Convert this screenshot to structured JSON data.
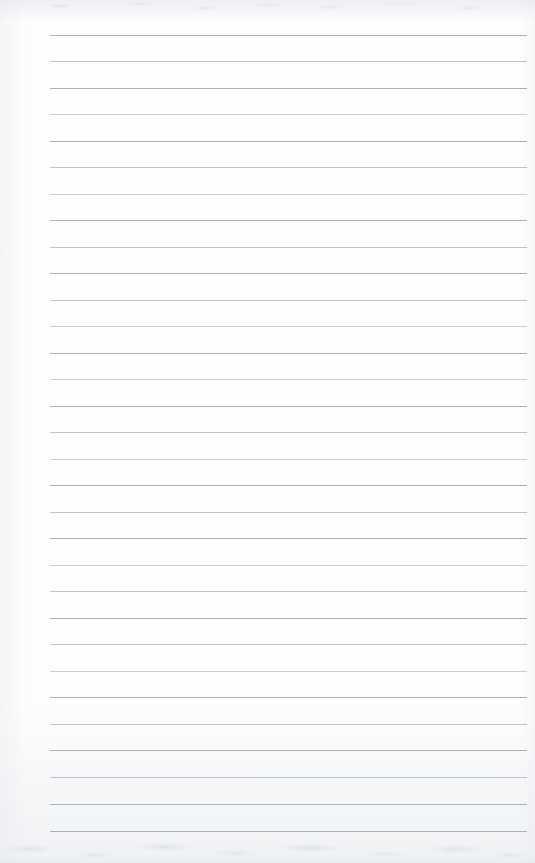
{
  "document": {
    "kind": "scanned-lined-notebook-page",
    "title": "Lined Notebook Page",
    "content_text": "",
    "is_blank": "true",
    "page_width": 535,
    "page_height": 863,
    "background_color": "#fdfdfd",
    "rule_color": "#a9b1bd",
    "rule_color_faint": "#bcc3cd",
    "rule_color_fainter": "#c8ced7"
  },
  "ruling": {
    "style": "horizontal-ruled",
    "line_count": 31,
    "first_line_y": 35,
    "line_spacing": 26.5,
    "line_left_x": 50,
    "line_right_x": 527,
    "line_thickness": 1,
    "vertical_margin_rule": "none",
    "left_margin_width": 50,
    "right_margin_width": 8
  },
  "lines": [
    {
      "index": 1,
      "y": 35,
      "tone": "normal"
    },
    {
      "index": 2,
      "y": 61,
      "tone": "faint"
    },
    {
      "index": 3,
      "y": 88,
      "tone": "normal"
    },
    {
      "index": 4,
      "y": 114,
      "tone": "fainter"
    },
    {
      "index": 5,
      "y": 141,
      "tone": "normal"
    },
    {
      "index": 6,
      "y": 167,
      "tone": "faint"
    },
    {
      "index": 7,
      "y": 194,
      "tone": "fainter"
    },
    {
      "index": 8,
      "y": 220,
      "tone": "normal"
    },
    {
      "index": 9,
      "y": 247,
      "tone": "faint"
    },
    {
      "index": 10,
      "y": 273,
      "tone": "normal"
    },
    {
      "index": 11,
      "y": 300,
      "tone": "faint"
    },
    {
      "index": 12,
      "y": 326,
      "tone": "fainter"
    },
    {
      "index": 13,
      "y": 353,
      "tone": "normal"
    },
    {
      "index": 14,
      "y": 379,
      "tone": "fainter"
    },
    {
      "index": 15,
      "y": 406,
      "tone": "normal"
    },
    {
      "index": 16,
      "y": 432,
      "tone": "faint"
    },
    {
      "index": 17,
      "y": 459,
      "tone": "fainter"
    },
    {
      "index": 18,
      "y": 485,
      "tone": "normal"
    },
    {
      "index": 19,
      "y": 512,
      "tone": "faint"
    },
    {
      "index": 20,
      "y": 538,
      "tone": "normal"
    },
    {
      "index": 21,
      "y": 565,
      "tone": "fainter"
    },
    {
      "index": 22,
      "y": 591,
      "tone": "faint"
    },
    {
      "index": 23,
      "y": 618,
      "tone": "normal"
    },
    {
      "index": 24,
      "y": 644,
      "tone": "faint"
    },
    {
      "index": 25,
      "y": 671,
      "tone": "fainter"
    },
    {
      "index": 26,
      "y": 697,
      "tone": "normal"
    },
    {
      "index": 27,
      "y": 724,
      "tone": "faint"
    },
    {
      "index": 28,
      "y": 750,
      "tone": "normal"
    },
    {
      "index": 29,
      "y": 777,
      "tone": "faint"
    },
    {
      "index": 30,
      "y": 804,
      "tone": "normal"
    },
    {
      "index": 31,
      "y": 831,
      "tone": "normal"
    }
  ]
}
